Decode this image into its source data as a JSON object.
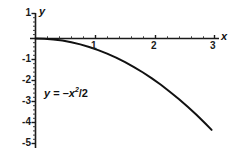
{
  "chart_data": {
    "type": "line",
    "title": "",
    "subtitle": "",
    "xlabel": "x",
    "ylabel": "y",
    "equation": "y = -x^2/2",
    "annotation": "y = -x²/2",
    "grid": false,
    "legend": null,
    "xlim": [
      0,
      3.15
    ],
    "ylim": [
      -5,
      1
    ],
    "x_ticks": [
      1,
      2,
      3
    ],
    "x_tick_labels": [
      "1",
      "2",
      "3"
    ],
    "y_ticks": [
      1,
      -1,
      -2,
      -3,
      -4,
      -5
    ],
    "y_tick_labels": [
      "1",
      "-1",
      "-2",
      "-3",
      "-4",
      "-5"
    ],
    "minor_ticks": true,
    "x": [
      0,
      0.15,
      0.3,
      0.45,
      0.6,
      0.75,
      0.9,
      1.05,
      1.2,
      1.35,
      1.5,
      1.65,
      1.8,
      1.95,
      2.1,
      2.25,
      2.4,
      2.55,
      2.7,
      2.85,
      2.95
    ],
    "values": [
      0,
      -0.011,
      -0.045,
      -0.101,
      -0.18,
      -0.281,
      -0.405,
      -0.551,
      -0.72,
      -0.911,
      -1.125,
      -1.361,
      -1.62,
      -1.901,
      -2.205,
      -2.531,
      -2.88,
      -3.251,
      -3.645,
      -4.061,
      -4.351
    ],
    "series": [
      {
        "name": "y = -x²/2",
        "color": "#111111",
        "x": [
          0,
          0.15,
          0.3,
          0.45,
          0.6,
          0.75,
          0.9,
          1.05,
          1.2,
          1.35,
          1.5,
          1.65,
          1.8,
          1.95,
          2.1,
          2.25,
          2.4,
          2.55,
          2.7,
          2.85,
          2.95
        ],
        "values": [
          0,
          -0.011,
          -0.045,
          -0.101,
          -0.18,
          -0.281,
          -0.405,
          -0.551,
          -0.72,
          -0.911,
          -1.125,
          -1.361,
          -1.62,
          -1.901,
          -2.205,
          -2.531,
          -2.88,
          -3.251,
          -3.645,
          -4.061,
          -4.351
        ]
      }
    ],
    "colors": {
      "curve": "#111111",
      "axis": "#1a1a1a",
      "text": "#111111",
      "background": "#ffffff"
    }
  },
  "axes": {
    "x_axis_name": "x",
    "y_axis_name": "y"
  },
  "x_tick_items": [
    {
      "label": "1"
    },
    {
      "label": "2"
    },
    {
      "label": "3"
    }
  ],
  "y_tick_items": [
    {
      "label": "1"
    },
    {
      "label": "-1"
    },
    {
      "label": "-2"
    },
    {
      "label": "-3"
    },
    {
      "label": "-4"
    },
    {
      "label": "-5"
    }
  ],
  "equation": {
    "lhs": "y",
    "eq": " = –",
    "base": "x",
    "exponent": "2",
    "denominator": "/2"
  }
}
